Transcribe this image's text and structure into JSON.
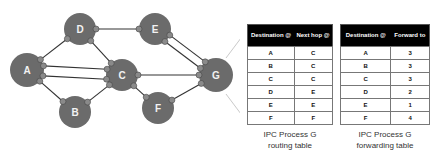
{
  "diagram": {
    "nodes": [
      {
        "id": "A",
        "label": "A",
        "x": 27,
        "y": 70,
        "r": 17
      },
      {
        "id": "B",
        "label": "B",
        "x": 75,
        "y": 112,
        "r": 16
      },
      {
        "id": "C",
        "label": "C",
        "x": 122,
        "y": 75,
        "r": 16
      },
      {
        "id": "D",
        "label": "D",
        "x": 80,
        "y": 29,
        "r": 16
      },
      {
        "id": "E",
        "label": "E",
        "x": 155,
        "y": 29,
        "r": 16
      },
      {
        "id": "F",
        "label": "F",
        "x": 158,
        "y": 108,
        "r": 16
      },
      {
        "id": "G",
        "label": "G",
        "x": 216,
        "y": 75,
        "r": 17
      }
    ],
    "links": [
      {
        "from": "A",
        "to": "D"
      },
      {
        "from": "A",
        "to": "B"
      },
      {
        "from": "A",
        "to": "C",
        "offset": -5
      },
      {
        "from": "A",
        "to": "C",
        "offset": 5
      },
      {
        "from": "B",
        "to": "C"
      },
      {
        "from": "D",
        "to": "E"
      },
      {
        "from": "D",
        "to": "C"
      },
      {
        "from": "C",
        "to": "G"
      },
      {
        "from": "C",
        "to": "F"
      },
      {
        "from": "E",
        "to": "G",
        "offset": -4
      },
      {
        "from": "E",
        "to": "G",
        "offset": 4
      },
      {
        "from": "F",
        "to": "G"
      }
    ],
    "node_color": "#6b6b6b",
    "port_color": "#8a8a8a",
    "link_color": "#333333"
  },
  "routing_table": {
    "headers": [
      "Destination @",
      "Next hop @"
    ],
    "rows": [
      [
        "A",
        "C"
      ],
      [
        "B",
        "C"
      ],
      [
        "C",
        "C"
      ],
      [
        "D",
        "E"
      ],
      [
        "E",
        "E"
      ],
      [
        "F",
        "F"
      ]
    ],
    "caption_line1": "IPC Process G",
    "caption_line2": "routing table"
  },
  "forwarding_table": {
    "headers": [
      "Destination @",
      "Forward to"
    ],
    "rows": [
      [
        "A",
        "3"
      ],
      [
        "B",
        "3"
      ],
      [
        "C",
        "3"
      ],
      [
        "D",
        "2"
      ],
      [
        "E",
        "1"
      ],
      [
        "F",
        "4"
      ]
    ],
    "caption_line1": "IPC Process G",
    "caption_line2": "forwarding table"
  }
}
